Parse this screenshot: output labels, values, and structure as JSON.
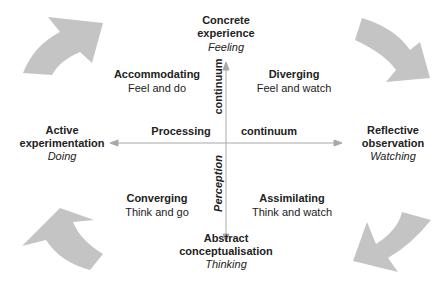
{
  "diagram": {
    "poles": {
      "top": {
        "title_line1": "Concrete",
        "title_line2": "experience",
        "subtitle": "Feeling"
      },
      "bottom": {
        "title_line1": "Abstract",
        "title_line2": "conceptualisation",
        "subtitle": "Thinking"
      },
      "left": {
        "title_line1": "Active",
        "title_line2": "experimentation",
        "subtitle": "Doing"
      },
      "right": {
        "title_line1": "Reflective",
        "title_line2": "observation",
        "subtitle": "Watching"
      }
    },
    "quadrants": {
      "top_left": {
        "title": "Accommodating",
        "desc": "Feel and do"
      },
      "top_right": {
        "title": "Diverging",
        "desc": "Feel and watch"
      },
      "bottom_left": {
        "title": "Converging",
        "desc": "Think and go"
      },
      "bottom_right": {
        "title": "Assimilating",
        "desc": "Think and watch"
      }
    },
    "axes": {
      "horizontal_left_label": "Processing",
      "horizontal_right_label": "continuum",
      "vertical_top_label": "continuum",
      "vertical_bottom_label": "Perception"
    },
    "colors": {
      "arrow_fill": "#c4c4c4",
      "axis_line": "#a8a8a8",
      "text": "#222222"
    }
  }
}
